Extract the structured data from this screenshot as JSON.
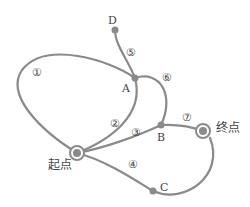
{
  "diagram": {
    "colors": {
      "edge": "#8a8a8a",
      "node": "#8a8a8a",
      "text": "#444444",
      "background": "#ffffff"
    },
    "nodes": {
      "start": {
        "label": "起点"
      },
      "end": {
        "label": "终点"
      },
      "A": {
        "label": "A"
      },
      "B": {
        "label": "B"
      },
      "C": {
        "label": "C"
      },
      "D": {
        "label": "D"
      }
    },
    "edges": [
      {
        "id": "1",
        "label": "①",
        "from": "起点",
        "to": "A"
      },
      {
        "id": "2",
        "label": "②",
        "from": "起点",
        "to": "A"
      },
      {
        "id": "3",
        "label": "③",
        "from": "起点",
        "to": "B"
      },
      {
        "id": "4",
        "label": "④",
        "from": "起点",
        "to": "C"
      },
      {
        "id": "5",
        "label": "⑤",
        "from": "A",
        "to": "D"
      },
      {
        "id": "6",
        "label": "⑥",
        "from": "A",
        "to": "B"
      },
      {
        "id": "7",
        "label": "⑦",
        "from": "B",
        "to": "终点"
      },
      {
        "id": "8",
        "label": "",
        "from": "C",
        "to": "终点"
      }
    ]
  }
}
